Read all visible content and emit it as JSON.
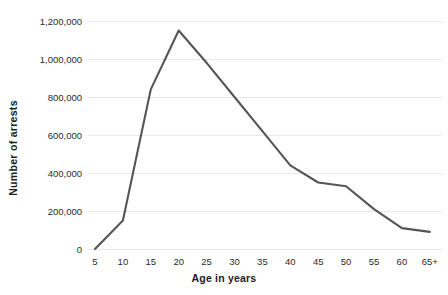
{
  "chart_data": {
    "type": "line",
    "title": "",
    "xlabel": "Age in years",
    "ylabel": "Number of arrests",
    "categories": [
      "5",
      "10",
      "15",
      "20",
      "25",
      "30",
      "35",
      "40",
      "45",
      "50",
      "55",
      "60",
      "65+"
    ],
    "values": [
      0,
      150000,
      840000,
      1150000,
      980000,
      800000,
      620000,
      440000,
      350000,
      330000,
      210000,
      110000,
      90000
    ],
    "series": [
      {
        "name": "Number of arrests",
        "values": [
          0,
          150000,
          840000,
          1150000,
          980000,
          800000,
          620000,
          440000,
          350000,
          330000,
          210000,
          110000,
          90000
        ]
      }
    ],
    "ytick_labels": [
      "0",
      "200,000",
      "400,000",
      "600,000",
      "800,000",
      "1,000,000",
      "1,200,000"
    ],
    "ytick_values": [
      0,
      200000,
      400000,
      600000,
      800000,
      1000000,
      1200000
    ],
    "ylim": [
      0,
      1200000
    ],
    "grid": "horizontal",
    "legend": "none",
    "line_color": "#555555",
    "grid_color": "#e9e9e9",
    "background_color": "#ffffff",
    "text_color": "#1c1c1c"
  }
}
